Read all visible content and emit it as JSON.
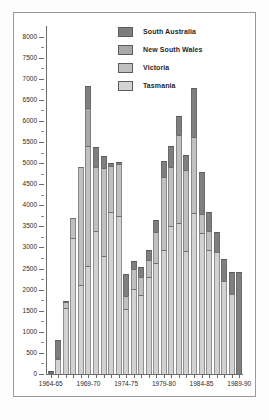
{
  "chart_data": {
    "type": "bar",
    "stacked": true,
    "title": "",
    "xlabel": "",
    "ylabel": "",
    "ylim": [
      0,
      8250
    ],
    "ytick_step": 500,
    "yticks": [
      0,
      500,
      1000,
      1500,
      2000,
      2500,
      3000,
      3500,
      4000,
      4500,
      5000,
      5500,
      6000,
      6500,
      7000,
      7500,
      8000
    ],
    "ytick_labels": [
      "0",
      "500",
      "1000",
      "1500",
      "2000",
      "2500",
      "3000",
      "3500",
      "4000",
      "4500",
      "5000",
      "5500",
      "6000",
      "6500",
      "7000",
      "7500",
      "8000"
    ],
    "grid": false,
    "legend_position": "top-center",
    "categories": [
      "1964-65",
      "1965-66",
      "1966-67",
      "1967-68",
      "1968-69",
      "1969-70",
      "1970-71",
      "1971-72",
      "1972-73",
      "1973-74",
      "1974-75",
      "1975-76",
      "1976-77",
      "1977-78",
      "1978-79",
      "1979-80",
      "1980-81",
      "1981-82",
      "1982-83",
      "1983-84",
      "1984-85",
      "1985-86",
      "1986-87",
      "1987-88",
      "1988-89",
      "1989-90"
    ],
    "xtick_labels": [
      "1964-65",
      "1969-70",
      "1974-75",
      "1979-80",
      "1984-85",
      "1989-90"
    ],
    "xtick_indices": [
      0,
      5,
      10,
      15,
      20,
      25
    ],
    "series": [
      {
        "name": "Tasmania",
        "color": "#d2d2d2",
        "values": [
          30,
          360,
          1570,
          3230,
          2100,
          2550,
          3390,
          2800,
          3830,
          3740,
          1530,
          2020,
          1880,
          2310,
          2620,
          2930,
          3510,
          3570,
          2910,
          3810,
          3340,
          2930,
          2890,
          2200,
          1890,
          0
        ]
      },
      {
        "name": "Victoria",
        "color": "#c0c0c0",
        "values": [
          15,
          20,
          140,
          480,
          2800,
          2860,
          1510,
          2090,
          1110,
          1240,
          310,
          460,
          410,
          400,
          740,
          1730,
          1390,
          2090,
          1930,
          1810,
          460,
          470,
          0,
          0,
          0,
          0
        ]
      },
      {
        "name": "New South Wales",
        "color": "#a8a8a8",
        "values": [
          0,
          0,
          0,
          0,
          0,
          890,
          0,
          0,
          0,
          0,
          0,
          0,
          0,
          0,
          0,
          0,
          0,
          0,
          0,
          0,
          0,
          0,
          0,
          0,
          0,
          0
        ]
      },
      {
        "name": "South Australia",
        "color": "#7f7f7f",
        "values": [
          20,
          430,
          10,
          0,
          0,
          530,
          480,
          280,
          60,
          40,
          530,
          210,
          240,
          220,
          280,
          390,
          500,
          450,
          360,
          1150,
          1000,
          440,
          480,
          530,
          520,
          2410
        ]
      }
    ]
  },
  "legend": {
    "items": [
      {
        "label": "South Australia",
        "color": "#7f7f7f"
      },
      {
        "label": "New South Wales",
        "color": "#a8a8a8"
      },
      {
        "label": "Victoria",
        "color": "#c0c0c0"
      },
      {
        "label": "Tasmania",
        "color": "#d2d2d2"
      }
    ]
  }
}
